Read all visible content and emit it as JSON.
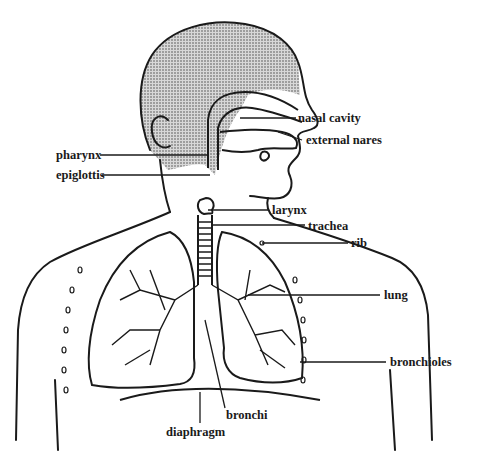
{
  "diagram": {
    "labels": {
      "nasal_cavity": "nasal cavity",
      "external_nares": "external nares",
      "pharynx": "pharynx",
      "epiglottis": "epiglottis",
      "larynx": "larynx",
      "trachea": "trachea",
      "rib": "rib",
      "lung": "lung",
      "bronchioles": "bronchioles",
      "bronchi": "bronchi",
      "diaphragm": "diaphragm"
    },
    "colors": {
      "line": "#1a1a1a",
      "head_shading": "#9a9a9a",
      "background": "#ffffff"
    }
  }
}
